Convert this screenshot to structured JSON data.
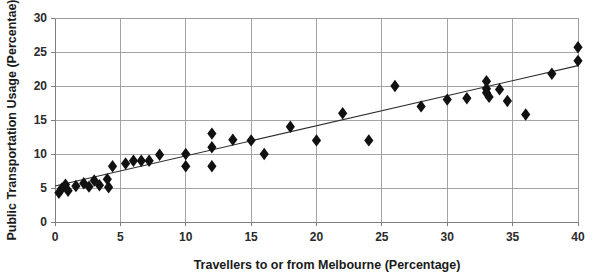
{
  "chart_data": {
    "type": "scatter",
    "title": "",
    "xlabel": "Travellers to or from Melbourne (Percentage)",
    "ylabel": "Public Transportation Usage (Percentae)",
    "xlim": [
      0,
      40
    ],
    "ylim": [
      0,
      30
    ],
    "xticks": [
      0,
      5,
      10,
      15,
      20,
      25,
      30,
      35,
      40
    ],
    "yticks": [
      0,
      5,
      10,
      15,
      20,
      25,
      30
    ],
    "xtick_labels": [
      "0",
      "5",
      "10",
      "15",
      "20",
      "25",
      "30",
      "35",
      "40"
    ],
    "ytick_labels": [
      "0",
      "5",
      "10",
      "15",
      "20",
      "25",
      "30"
    ],
    "grid": "horizontal-and-vertical",
    "legend": "none",
    "marker_style": "filled-diamond",
    "marker_color": "#111111",
    "points": [
      {
        "x": 0.3,
        "y": 4.3
      },
      {
        "x": 0.5,
        "y": 4.9
      },
      {
        "x": 0.8,
        "y": 5.5
      },
      {
        "x": 1.0,
        "y": 4.6
      },
      {
        "x": 1.6,
        "y": 5.3
      },
      {
        "x": 2.2,
        "y": 5.7
      },
      {
        "x": 2.6,
        "y": 5.2
      },
      {
        "x": 3.0,
        "y": 6.1
      },
      {
        "x": 3.4,
        "y": 5.4
      },
      {
        "x": 4.0,
        "y": 6.3
      },
      {
        "x": 4.1,
        "y": 5.1
      },
      {
        "x": 4.4,
        "y": 8.2
      },
      {
        "x": 5.4,
        "y": 8.6
      },
      {
        "x": 6.0,
        "y": 9.0
      },
      {
        "x": 6.6,
        "y": 9.0
      },
      {
        "x": 7.2,
        "y": 9.0
      },
      {
        "x": 8.0,
        "y": 9.9
      },
      {
        "x": 10.0,
        "y": 10.0
      },
      {
        "x": 10.0,
        "y": 8.2
      },
      {
        "x": 12.0,
        "y": 13.0
      },
      {
        "x": 12.0,
        "y": 11.0
      },
      {
        "x": 12.0,
        "y": 8.2
      },
      {
        "x": 13.6,
        "y": 12.1
      },
      {
        "x": 15.0,
        "y": 12.0
      },
      {
        "x": 16.0,
        "y": 10.0
      },
      {
        "x": 18.0,
        "y": 14.0
      },
      {
        "x": 20.0,
        "y": 12.0
      },
      {
        "x": 22.0,
        "y": 16.0
      },
      {
        "x": 24.0,
        "y": 12.0
      },
      {
        "x": 26.0,
        "y": 20.0
      },
      {
        "x": 28.0,
        "y": 17.0
      },
      {
        "x": 30.0,
        "y": 18.0
      },
      {
        "x": 31.5,
        "y": 18.2
      },
      {
        "x": 33.0,
        "y": 20.7
      },
      {
        "x": 33.0,
        "y": 19.6
      },
      {
        "x": 33.0,
        "y": 19.0
      },
      {
        "x": 33.2,
        "y": 18.4
      },
      {
        "x": 34.0,
        "y": 19.5
      },
      {
        "x": 34.6,
        "y": 17.8
      },
      {
        "x": 36.0,
        "y": 15.8
      },
      {
        "x": 38.0,
        "y": 21.8
      },
      {
        "x": 40.0,
        "y": 25.7
      },
      {
        "x": 40.0,
        "y": 23.7
      }
    ],
    "trendline": {
      "visible": true,
      "x_start": 0,
      "y_start": 5.3,
      "x_end": 40,
      "y_end": 23.0,
      "color": "#2d2d2d"
    }
  }
}
